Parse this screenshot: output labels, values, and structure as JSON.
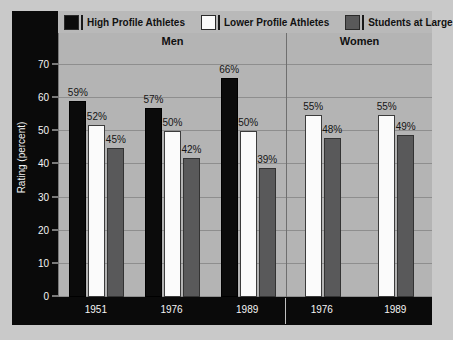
{
  "chart_data": {
    "type": "bar",
    "title": "",
    "xlabel": "",
    "ylabel": "Rating (percent)",
    "ylim": [
      0,
      70
    ],
    "yticks": [
      0,
      10,
      20,
      30,
      40,
      50,
      60,
      70
    ],
    "grid": true,
    "legend_position": "top",
    "value_suffix": "%",
    "legend": [
      {
        "name": "High Profile Athletes",
        "color": "#0b0b0b",
        "icon": "legend-swatch-black"
      },
      {
        "name": "Lower Profile Athletes",
        "color": "#fbfbfb",
        "icon": "legend-swatch-white"
      },
      {
        "name": "Students at Large",
        "color": "#59595a",
        "icon": "legend-swatch-gray"
      }
    ],
    "panels": [
      {
        "title": "Men",
        "categories": [
          "1951",
          "1976",
          "1989"
        ],
        "series": [
          {
            "name": "High Profile Athletes",
            "values": [
              59,
              52,
              45
            ]
          }
        ],
        "groups": [
          {
            "category": "1951",
            "bars": [
              {
                "series": "High Profile Athletes",
                "value": 59,
                "label": "59%"
              },
              {
                "series": "Lower Profile Athletes",
                "value": 52,
                "label": "52%"
              },
              {
                "series": "Students at Large",
                "value": 45,
                "label": "45%"
              }
            ]
          },
          {
            "category": "1976",
            "bars": [
              {
                "series": "High Profile Athletes",
                "value": 57,
                "label": "57%"
              },
              {
                "series": "Lower Profile Athletes",
                "value": 50,
                "label": "50%"
              },
              {
                "series": "Students at Large",
                "value": 42,
                "label": "42%"
              }
            ]
          },
          {
            "category": "1989",
            "bars": [
              {
                "series": "High Profile Athletes",
                "value": 66,
                "label": "66%"
              },
              {
                "series": "Lower Profile Athletes",
                "value": 50,
                "label": "50%"
              },
              {
                "series": "Students at Large",
                "value": 39,
                "label": "39%"
              }
            ]
          }
        ]
      },
      {
        "title": "Women",
        "categories": [
          "1976",
          "1989"
        ],
        "groups": [
          {
            "category": "1976",
            "bars": [
              {
                "series": "Lower Profile Athletes",
                "value": 55,
                "label": "55%"
              },
              {
                "series": "Students at Large",
                "value": 48,
                "label": "48%"
              }
            ]
          },
          {
            "category": "1989",
            "bars": [
              {
                "series": "Lower Profile Athletes",
                "value": 55,
                "label": "55%"
              },
              {
                "series": "Students at Large",
                "value": 49,
                "label": "49%"
              }
            ]
          }
        ]
      }
    ],
    "colors": {
      "high_profile": "#0b0b0b",
      "lower_profile": "#fbfbfb",
      "students_at_large": "#59595a",
      "plot_background": "#b4b4b4",
      "frame": "#0a0a0a",
      "page_background": "#c9c9c9",
      "gridline": "#8e8e8e"
    }
  }
}
